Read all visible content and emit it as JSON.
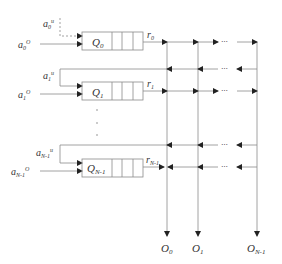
{
  "diagram": {
    "colors": {
      "line": "#888888",
      "arrow": "#222222",
      "text": "#333333"
    },
    "queues": [
      {
        "label": "Q",
        "sub": "0",
        "in_u": {
          "base": "a",
          "sub": "0",
          "sup": "u"
        },
        "in_o": {
          "base": "a",
          "sub": "0",
          "sup": "O"
        },
        "out": {
          "base": "r",
          "sub": "0"
        }
      },
      {
        "label": "Q",
        "sub": "1",
        "in_u": {
          "base": "a",
          "sub": "1",
          "sup": "u"
        },
        "in_o": {
          "base": "a",
          "sub": "1",
          "sup": "O"
        },
        "out": {
          "base": "r",
          "sub": "1"
        }
      },
      {
        "label": "Q",
        "sub": "N-1",
        "in_u": {
          "base": "a",
          "sub": "N-1",
          "sup": "u"
        },
        "in_o": {
          "base": "a",
          "sub": "N-1",
          "sup": "O"
        },
        "out": {
          "base": "r",
          "sub": "N-1"
        }
      }
    ],
    "outputs": [
      {
        "base": "O",
        "sub": "0"
      },
      {
        "base": "O",
        "sub": "1"
      },
      {
        "base": "O",
        "sub": "N-1"
      }
    ],
    "ellipsis": "···"
  }
}
